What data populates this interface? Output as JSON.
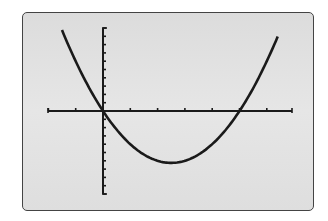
{
  "chart_data": {
    "type": "line",
    "title": "",
    "xlabel": "",
    "ylabel": "",
    "function": "y = x^2 - 5x",
    "xlim": [
      -2,
      7
    ],
    "ylim": [
      -10,
      10
    ],
    "xscl": 1,
    "yscl": 1,
    "grid": false,
    "legend": null,
    "series": [
      {
        "name": "parabola",
        "x": [
          -1.5,
          -1,
          0,
          1,
          2,
          2.5,
          3,
          4,
          5,
          6,
          6.4
        ],
        "y": [
          9.75,
          6,
          0,
          -4,
          -6,
          -6.25,
          -6,
          -4,
          0,
          6,
          8.96
        ]
      }
    ],
    "annotations": [
      "x-intercepts at x=0 and x=5",
      "vertex near (2.5, -6.25)"
    ]
  },
  "colors": {
    "screen_bg": "#e0e0e0",
    "frame": "#444444",
    "curve": "#1a1a1a",
    "axes": "#1a1a1a"
  }
}
